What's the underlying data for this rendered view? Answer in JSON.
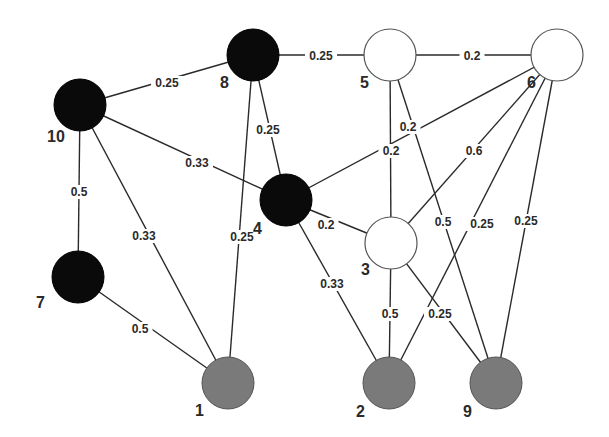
{
  "diagram": {
    "type": "weighted-undirected-graph",
    "colors": {
      "black": "#0a0a0a",
      "white": "#ffffff",
      "gray": "#7a7a7a"
    },
    "nodes": [
      {
        "id": "10",
        "label": "10",
        "color": "black"
      },
      {
        "id": "8",
        "label": "8",
        "color": "black"
      },
      {
        "id": "5",
        "label": "5",
        "color": "white"
      },
      {
        "id": "6",
        "label": "6",
        "color": "white"
      },
      {
        "id": "4",
        "label": "4",
        "color": "black"
      },
      {
        "id": "3",
        "label": "3",
        "color": "white"
      },
      {
        "id": "7",
        "label": "7",
        "color": "black"
      },
      {
        "id": "1",
        "label": "1",
        "color": "gray"
      },
      {
        "id": "2",
        "label": "2",
        "color": "gray"
      },
      {
        "id": "9",
        "label": "9",
        "color": "gray"
      }
    ],
    "edges": [
      {
        "from": "10",
        "to": "8",
        "weight": "0.25"
      },
      {
        "from": "8",
        "to": "5",
        "weight": "0.25"
      },
      {
        "from": "5",
        "to": "6",
        "weight": "0.2"
      },
      {
        "from": "10",
        "to": "4",
        "weight": "0.33"
      },
      {
        "from": "10",
        "to": "7",
        "weight": "0.5"
      },
      {
        "from": "10",
        "to": "1",
        "weight": "0.33"
      },
      {
        "from": "8",
        "to": "4",
        "weight": "0.25"
      },
      {
        "from": "8",
        "to": "1",
        "weight": "0.25"
      },
      {
        "from": "4",
        "to": "6",
        "weight": "0.2"
      },
      {
        "from": "5",
        "to": "3",
        "weight": "0.2"
      },
      {
        "from": "6",
        "to": "3",
        "weight": "0.6"
      },
      {
        "from": "4",
        "to": "3",
        "weight": "0.2"
      },
      {
        "from": "4",
        "to": "2",
        "weight": "0.33"
      },
      {
        "from": "7",
        "to": "1",
        "weight": "0.5"
      },
      {
        "from": "3",
        "to": "2",
        "weight": "0.5"
      },
      {
        "from": "3",
        "to": "9",
        "weight": "0.25"
      },
      {
        "from": "5",
        "to": "9",
        "weight": "0.5"
      },
      {
        "from": "6",
        "to": "2",
        "weight": "0.25"
      },
      {
        "from": "6",
        "to": "9",
        "weight": "0.25"
      }
    ]
  }
}
